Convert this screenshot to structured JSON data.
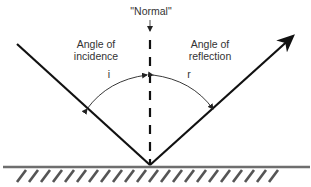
{
  "diagram": {
    "type": "law-of-reflection",
    "labels": {
      "normal": "\"Normal\"",
      "incidence_line1": "Angle of",
      "incidence_line2": "incidence",
      "reflection_line1": "Angle of",
      "reflection_line2": "reflection",
      "angle_i": "i",
      "angle_r": "r"
    },
    "colors": {
      "ray": "#111111",
      "surface": "#6e6e6e",
      "hatch": "#555555",
      "text": "#333333",
      "arc": "#222222"
    },
    "geometry": {
      "vertex": [
        150,
        165
      ],
      "incident_start": [
        17,
        44
      ],
      "reflected_end": [
        290,
        38
      ],
      "normal_top": 28,
      "surface_y": 167,
      "surface_x_range": [
        3,
        310
      ]
    }
  }
}
